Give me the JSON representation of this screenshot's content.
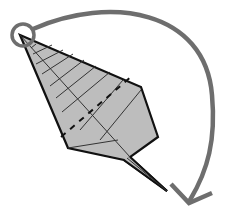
{
  "figure": {
    "title": "",
    "colors": {
      "leaf_fill": "#bdbdbd",
      "outline": "#111111",
      "crease": "#333333",
      "arrow": "#6e6e6e",
      "background": "#ffffff"
    },
    "leaf": {
      "outline_points": "20,35 141,87 158,137 130,157 167,191 124,160 68,148",
      "midrib": "20,35 130,157",
      "veins": [
        "31,48 36,44",
        "33,54 52,45",
        "36,64 63,50",
        "42,74 73,54",
        "50,86 84,60",
        "56,98 96,66",
        "62,112 110,72",
        "80,130 123,80",
        "100,140 141,90",
        "68,148 118,140"
      ],
      "valley_fold_dashed": "61,137 132,76",
      "stem": [
        "130,157 167,191",
        "124,160 167,191",
        "127,158 167,191"
      ]
    },
    "pivot_marker": {
      "cx": 23,
      "cy": 35,
      "r": 11,
      "name": "rotation-pivot"
    },
    "arrow": {
      "path": "M 33,29 C 110,-5 205,10 212,95 C 216,140 208,170 190,200",
      "head": "171,184 189,203 212,193"
    }
  }
}
